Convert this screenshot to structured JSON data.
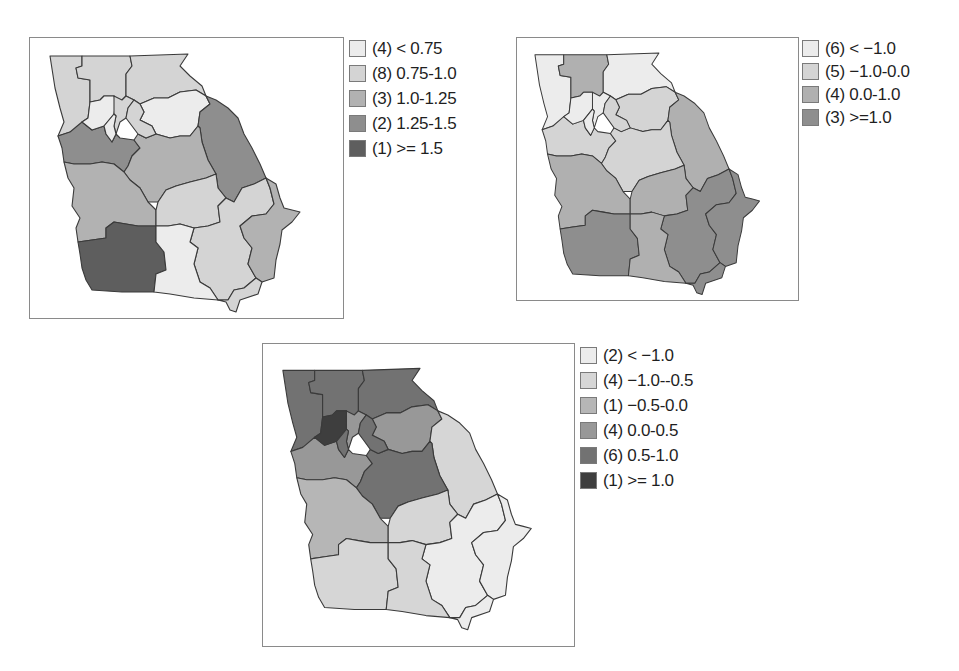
{
  "chart_data": [
    {
      "type": "choropleth",
      "region": "Georgia (US state), 20 sub-state regions",
      "title": "",
      "legend_position": "right",
      "legend": [
        {
          "count": 4,
          "label": "< 0.75",
          "color": "#ececec"
        },
        {
          "count": 8,
          "label": "0.75-1.0",
          "color": "#d4d4d4"
        },
        {
          "count": 3,
          "label": "1.0-1.25",
          "color": "#b2b2b2"
        },
        {
          "count": 2,
          "label": "1.25-1.5",
          "color": "#8e8e8e"
        },
        {
          "count": 1,
          "label": ">= 1.5",
          "color": "#5e5e5e"
        }
      ]
    },
    {
      "type": "choropleth",
      "region": "Georgia (US state), 18 sub-state regions",
      "title": "",
      "legend_position": "right",
      "legend": [
        {
          "count": 6,
          "label": "< −1.0",
          "color": "#ececec"
        },
        {
          "count": 5,
          "label": "−1.0-0.0",
          "color": "#d4d4d4"
        },
        {
          "count": 4,
          "label": "0.0-1.0",
          "color": "#b0b0b0"
        },
        {
          "count": 3,
          "label": ">=1.0",
          "color": "#8e8e8e"
        }
      ]
    },
    {
      "type": "choropleth",
      "region": "Georgia (US state), 18 sub-state regions",
      "title": "",
      "legend_position": "right",
      "legend": [
        {
          "count": 2,
          "label": "< −1.0",
          "color": "#ececec"
        },
        {
          "count": 4,
          "label": "−1.0--0.5",
          "color": "#d6d6d6"
        },
        {
          "count": 1,
          "label": "−0.5-0.0",
          "color": "#b6b6b6"
        },
        {
          "count": 4,
          "label": "0.0-0.5",
          "color": "#989898"
        },
        {
          "count": 6,
          "label": "0.5-1.0",
          "color": "#727272"
        },
        {
          "count": 1,
          "label": ">= 1.0",
          "color": "#3e3e3e"
        }
      ]
    }
  ],
  "maps": [
    {
      "id": "map-a",
      "legend": [
        {
          "text": "(4) < 0.75",
          "color": "#ececec"
        },
        {
          "text": "(8) 0.75-1.0",
          "color": "#d4d4d4"
        },
        {
          "text": "(3) 1.0-1.25",
          "color": "#b2b2b2"
        },
        {
          "text": "(2) 1.25-1.5",
          "color": "#8e8e8e"
        },
        {
          "text": "(1) >= 1.5",
          "color": "#5e5e5e"
        }
      ],
      "fills": {
        "nw": "#d4d4d4",
        "n1": "#d4d4d4",
        "ne": "#d4d4d4",
        "metro_w": "#ececec",
        "metro_c": "#d4d4d4",
        "metro_e": "#d4d4d4",
        "metro_s": "#ececec",
        "ne2": "#ececec",
        "east": "#8e8e8e",
        "west": "#8e8e8e",
        "central": "#b2b2b2",
        "wc": "#b2b2b2",
        "c2": "#d4d4d4",
        "se1": "#d4d4d4",
        "coast": "#b2b2b2",
        "sw": "#5e5e5e",
        "sc": "#ececec",
        "s2": "#d4d4d4"
      }
    },
    {
      "id": "map-b",
      "legend": [
        {
          "text": "(6) < −1.0",
          "color": "#ececec"
        },
        {
          "text": "(5) −1.0-0.0",
          "color": "#d4d4d4"
        },
        {
          "text": "(4) 0.0-1.0",
          "color": "#b0b0b0"
        },
        {
          "text": "(3) >=1.0",
          "color": "#8e8e8e"
        }
      ],
      "fills": {
        "nw": "#ececec",
        "n1": "#b0b0b0",
        "ne": "#ececec",
        "metro_w": "#ececec",
        "metro_c": "#ececec",
        "metro_e": "#d4d4d4",
        "metro_s": "#ececec",
        "ne2": "#d4d4d4",
        "east": "#b0b0b0",
        "west": "#d4d4d4",
        "central": "#d4d4d4",
        "wc": "#b0b0b0",
        "c2": "#b0b0b0",
        "se1": "#8e8e8e",
        "coast": "#8e8e8e",
        "sw": "#8e8e8e",
        "sc": "#b0b0b0",
        "s2": "#8e8e8e"
      }
    },
    {
      "id": "map-c",
      "legend": [
        {
          "text": "(2) < −1.0",
          "color": "#ececec"
        },
        {
          "text": "(4) −1.0--0.5",
          "color": "#d6d6d6"
        },
        {
          "text": "(1) −0.5-0.0",
          "color": "#b6b6b6"
        },
        {
          "text": "(4) 0.0-0.5",
          "color": "#989898"
        },
        {
          "text": "(6) 0.5-1.0",
          "color": "#727272"
        },
        {
          "text": "(1) >= 1.0",
          "color": "#3e3e3e"
        }
      ],
      "fills": {
        "nw": "#727272",
        "n1": "#727272",
        "ne": "#727272",
        "metro_w": "#3e3e3e",
        "metro_c": "#989898",
        "metro_e": "#727272",
        "metro_s": "#727272",
        "ne2": "#989898",
        "east": "#d6d6d6",
        "west": "#989898",
        "central": "#727272",
        "wc": "#b6b6b6",
        "c2": "#d6d6d6",
        "se1": "#ececec",
        "coast": "#ececec",
        "sw": "#d6d6d6",
        "sc": "#d6d6d6",
        "s2": "#ececec"
      }
    }
  ]
}
